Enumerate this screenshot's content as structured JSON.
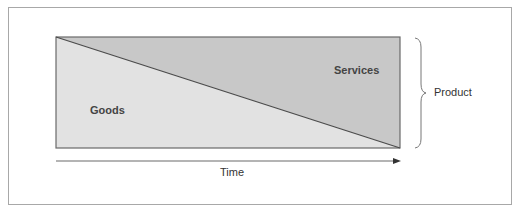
{
  "diagram": {
    "labels": {
      "goods": "Goods",
      "services": "Services",
      "product": "Product",
      "time": "Time"
    },
    "colors": {
      "goods_fill": "#e2e2e2",
      "services_fill": "#c8c8c8",
      "line": "#4a4a4a",
      "frame": "#a8a8a8"
    }
  }
}
